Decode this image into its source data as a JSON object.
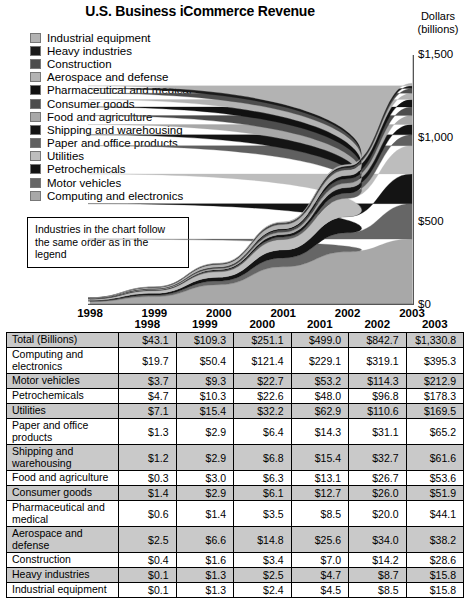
{
  "chart_title": "U.S. Business iCommerce Revenue",
  "axis_title_line1": "Dollars",
  "axis_title_line2": "(billions)",
  "note": {
    "line1": "Industries in the chart follow",
    "line2": "the same order as in the legend"
  },
  "legend": {
    "items": [
      {
        "label": "Industrial equipment",
        "color": "#b3b3b3"
      },
      {
        "label": "Heavy industries",
        "color": "#1a1a1a"
      },
      {
        "label": "Construction",
        "color": "#4d4d4d"
      },
      {
        "label": "Aerospace and defense",
        "color": "#b3b3b3"
      },
      {
        "label": "Pharmaceutical and medical",
        "color": "#111111"
      },
      {
        "label": "Consumer goods",
        "color": "#4d4d4d"
      },
      {
        "label": "Food and agriculture",
        "color": "#a8a8a8"
      },
      {
        "label": "Shipping and warehousing",
        "color": "#141414"
      },
      {
        "label": "Paper and office products",
        "color": "#606060"
      },
      {
        "label": "Utilities",
        "color": "#bdbdbd"
      },
      {
        "label": "Petrochemicals",
        "color": "#141414"
      },
      {
        "label": "Motor vehicles",
        "color": "#666666"
      },
      {
        "label": "Computing and electronics",
        "color": "#a8a8a8"
      }
    ]
  },
  "chart_data": {
    "type": "area",
    "title": "U.S. Business iCommerce Revenue",
    "xlabel": "",
    "ylabel": "Dollars (billions)",
    "ylim": [
      0,
      1500
    ],
    "yticks": [
      0,
      500,
      1000,
      1500
    ],
    "ytick_labels": [
      "$0",
      "$500",
      "$1,000",
      "$1,500"
    ],
    "grid": false,
    "legend_position": "top-left",
    "stacked": true,
    "categories": [
      "1998",
      "1999",
      "2000",
      "2001",
      "2002",
      "2003"
    ],
    "stack_order_bottom_to_top": [
      "Computing and electronics",
      "Motor vehicles",
      "Petrochemicals",
      "Utilities",
      "Paper and office products",
      "Shipping and warehousing",
      "Food and agriculture",
      "Consumer goods",
      "Pharmaceutical and medical",
      "Aerospace and defense",
      "Construction",
      "Heavy industries",
      "Industrial equipment"
    ],
    "series": [
      {
        "name": "Computing and electronics",
        "color": "#a8a8a8",
        "values": [
          19.7,
          50.4,
          121.4,
          229.1,
          319.1,
          395.3
        ]
      },
      {
        "name": "Motor vehicles",
        "color": "#666666",
        "values": [
          3.7,
          9.3,
          22.7,
          53.2,
          114.3,
          212.9
        ]
      },
      {
        "name": "Petrochemicals",
        "color": "#141414",
        "values": [
          4.7,
          10.3,
          22.6,
          48.0,
          96.8,
          178.3
        ]
      },
      {
        "name": "Utilities",
        "color": "#bdbdbd",
        "values": [
          7.1,
          15.4,
          32.2,
          62.9,
          110.6,
          169.5
        ]
      },
      {
        "name": "Paper and office products",
        "color": "#606060",
        "values": [
          1.3,
          2.9,
          6.4,
          14.3,
          31.1,
          65.2
        ]
      },
      {
        "name": "Shipping and warehousing",
        "color": "#141414",
        "values": [
          1.2,
          2.9,
          6.8,
          15.4,
          32.7,
          61.6
        ]
      },
      {
        "name": "Food and agriculture",
        "color": "#a8a8a8",
        "values": [
          0.3,
          3.0,
          6.3,
          13.1,
          26.7,
          53.6
        ]
      },
      {
        "name": "Consumer goods",
        "color": "#4d4d4d",
        "values": [
          1.4,
          2.9,
          6.1,
          12.7,
          26.0,
          51.9
        ]
      },
      {
        "name": "Pharmaceutical and medical",
        "color": "#111111",
        "values": [
          0.6,
          1.4,
          3.5,
          8.5,
          20.0,
          44.1
        ]
      },
      {
        "name": "Aerospace and defense",
        "color": "#b3b3b3",
        "values": [
          2.5,
          6.6,
          14.8,
          25.6,
          34.0,
          38.2
        ]
      },
      {
        "name": "Construction",
        "color": "#4d4d4d",
        "values": [
          0.4,
          1.6,
          3.4,
          7.0,
          14.2,
          28.6
        ]
      },
      {
        "name": "Heavy industries",
        "color": "#1a1a1a",
        "values": [
          0.1,
          1.3,
          2.5,
          4.7,
          8.7,
          15.8
        ]
      },
      {
        "name": "Industrial equipment",
        "color": "#b3b3b3",
        "values": [
          0.1,
          1.3,
          2.4,
          4.5,
          8.5,
          15.8
        ]
      }
    ],
    "totals": [
      43.1,
      109.3,
      251.1,
      499.0,
      842.7,
      1330.8
    ]
  },
  "table": {
    "columns": [
      "1998",
      "1999",
      "2000",
      "2001",
      "2002",
      "2003"
    ],
    "rows": [
      {
        "label": "Total (Billions)",
        "shaded": true,
        "values": [
          "$43.1",
          "$109.3",
          "$251.1",
          "$499.0",
          "$842.7",
          "$1,330.8"
        ]
      },
      {
        "label": "Computing and electronics",
        "shaded": false,
        "values": [
          "$19.7",
          "$50.4",
          "$121.4",
          "$229.1",
          "$319.1",
          "$395.3"
        ]
      },
      {
        "label": "Motor vehicles",
        "shaded": true,
        "values": [
          "$3.7",
          "$9.3",
          "$22.7",
          "$53.2",
          "$114.3",
          "$212.9"
        ]
      },
      {
        "label": "Petrochemicals",
        "shaded": false,
        "values": [
          "$4.7",
          "$10.3",
          "$22.6",
          "$48.0",
          "$96.8",
          "$178.3"
        ]
      },
      {
        "label": "Utilities",
        "shaded": true,
        "values": [
          "$7.1",
          "$15.4",
          "$32.2",
          "$62.9",
          "$110.6",
          "$169.5"
        ]
      },
      {
        "label": "Paper and office products",
        "shaded": false,
        "values": [
          "$1.3",
          "$2.9",
          "$6.4",
          "$14.3",
          "$31.1",
          "$65.2"
        ]
      },
      {
        "label": "Shipping and warehousing",
        "shaded": true,
        "values": [
          "$1.2",
          "$2.9",
          "$6.8",
          "$15.4",
          "$32.7",
          "$61.6"
        ]
      },
      {
        "label": "Food and agriculture",
        "shaded": false,
        "values": [
          "$0.3",
          "$3.0",
          "$6.3",
          "$13.1",
          "$26.7",
          "$53.6"
        ]
      },
      {
        "label": "Consumer goods",
        "shaded": true,
        "values": [
          "$1.4",
          "$2.9",
          "$6.1",
          "$12.7",
          "$26.0",
          "$51.9"
        ]
      },
      {
        "label": "Pharmaceutical and medical",
        "shaded": false,
        "values": [
          "$0.6",
          "$1.4",
          "$3.5",
          "$8.5",
          "$20.0",
          "$44.1"
        ]
      },
      {
        "label": "Aerospace and defense",
        "shaded": true,
        "values": [
          "$2.5",
          "$6.6",
          "$14.8",
          "$25.6",
          "$34.0",
          "$38.2"
        ]
      },
      {
        "label": "Construction",
        "shaded": false,
        "values": [
          "$0.4",
          "$1.6",
          "$3.4",
          "$7.0",
          "$14.2",
          "$28.6"
        ]
      },
      {
        "label": "Heavy industries",
        "shaded": true,
        "values": [
          "$0.1",
          "$1.3",
          "$2.5",
          "$4.7",
          "$8.7",
          "$15.8"
        ]
      },
      {
        "label": "Industrial equipment",
        "shaded": false,
        "values": [
          "$0.1",
          "$1.3",
          "$2.4",
          "$4.5",
          "$8.5",
          "$15.8"
        ]
      }
    ]
  }
}
